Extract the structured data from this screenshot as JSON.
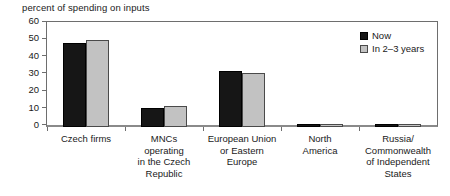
{
  "chart_data": {
    "type": "bar",
    "title": "percent of spending on inputs",
    "xlabel": "",
    "ylabel": "",
    "ylim": [
      0,
      60
    ],
    "yticks": [
      0,
      10,
      20,
      30,
      40,
      50,
      60
    ],
    "grid": false,
    "legend_position": "top-right",
    "categories": [
      "Czech firms",
      "MNCs operating in the Czech Republic",
      "European Union or Eastern Europe",
      "North America",
      "Russia/ Commonwealth of Independent States"
    ],
    "category_lines": [
      [
        "Czech firms"
      ],
      [
        "MNCs",
        "operating",
        "in the Czech",
        "Republic"
      ],
      [
        "European Union",
        "or Eastern",
        "Europe"
      ],
      [
        "North",
        "America"
      ],
      [
        "Russia/",
        "Commonwealth",
        "of Independent",
        "States"
      ]
    ],
    "series": [
      {
        "name": "Now",
        "color": "#161616",
        "values": [
          48,
          11,
          32,
          1.5,
          1.5
        ]
      },
      {
        "name": "In 2–3 years",
        "color": "#c2c2c2",
        "values": [
          50,
          12,
          31,
          1.5,
          1.5
        ]
      }
    ]
  },
  "axis": {
    "y_tick_labels": [
      "60",
      "50",
      "40",
      "30",
      "20",
      "10",
      "0"
    ]
  },
  "legend": {
    "items": [
      {
        "label": "Now"
      },
      {
        "label": "In 2–3 years"
      }
    ]
  }
}
